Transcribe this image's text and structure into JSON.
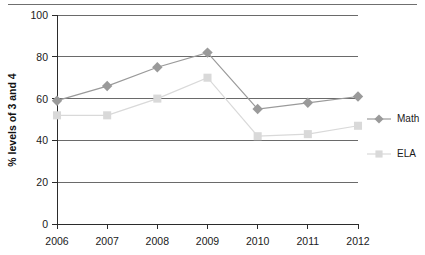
{
  "chart_data": {
    "type": "line",
    "title": "",
    "xlabel": "",
    "ylabel": "% levels of 3 and 4",
    "categories": [
      "2006",
      "2007",
      "2008",
      "2009",
      "2010",
      "2011",
      "2012"
    ],
    "series": [
      {
        "name": "Math",
        "marker": "diamond",
        "color": "#9a9a9a",
        "values": [
          59,
          66,
          75,
          82,
          55,
          58,
          61
        ]
      },
      {
        "name": "ELA",
        "marker": "square",
        "color": "#d9d9d9",
        "values": [
          52,
          52,
          60,
          70,
          42,
          43,
          47
        ]
      }
    ],
    "ylim": [
      0,
      100
    ],
    "yticks": [
      0,
      20,
      40,
      60,
      80,
      100
    ],
    "ytick_labels": [
      "0",
      "20",
      "40",
      "60",
      "80",
      "100"
    ],
    "xtick_labels": [
      "2006",
      "2007",
      "2008",
      "2009",
      "2010",
      "2011",
      "2012"
    ],
    "grid": "horizontal",
    "legend_position": "right"
  },
  "legend": {
    "entries": [
      {
        "label": "Math"
      },
      {
        "label": "ELA"
      }
    ]
  },
  "axes": {
    "y_label": "% levels of 3 and 4",
    "y_ticks": [
      "100",
      "80",
      "60",
      "40",
      "20",
      "0"
    ],
    "x_ticks": [
      "2006",
      "2007",
      "2008",
      "2009",
      "2010",
      "2011",
      "2012"
    ]
  },
  "colors": {
    "math": "#9a9a9a",
    "ela": "#d9d9d9",
    "grid": "#6a6a6a",
    "axis": "#2b2b2b",
    "text": "#1a1a1a"
  }
}
